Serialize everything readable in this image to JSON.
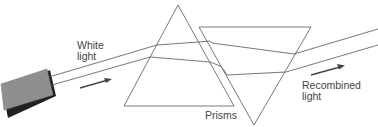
{
  "diagram": {
    "labels": {
      "white_light_line1": "White",
      "white_light_line2": "light",
      "prisms": "Prisms",
      "recombined_line1": "Recombined",
      "recombined_line2": "light"
    },
    "colors": {
      "line": "#555555",
      "light_source_fill": "#8f8f8f",
      "light_source_shadow": "#222222",
      "arrow": "#444444",
      "text": "#444444"
    }
  }
}
